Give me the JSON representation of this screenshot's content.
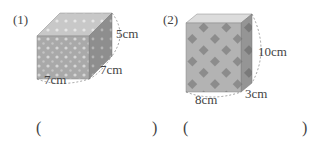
{
  "problems": [
    {
      "number": "(1)",
      "shape": "cuboid",
      "dimensions": {
        "length": "7cm",
        "width": "7cm",
        "height": "5cm"
      },
      "answer_open": "(",
      "answer_close": ")"
    },
    {
      "number": "(2)",
      "shape": "cuboid",
      "dimensions": {
        "length": "8cm",
        "width": "3cm",
        "height": "10cm"
      },
      "answer_open": "(",
      "answer_close": ")"
    }
  ]
}
